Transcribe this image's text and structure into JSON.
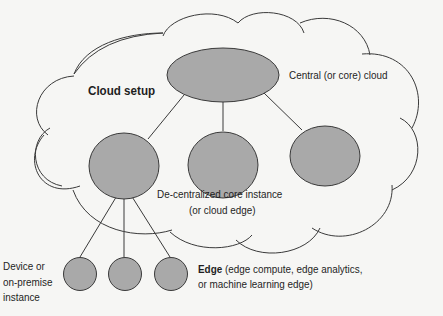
{
  "diagram": {
    "title": "Cloud setup",
    "colors": {
      "background": "#f6f6f4",
      "node_fill": "#a9a9a9",
      "stroke": "#3a3a3a",
      "text": "#1e1e1e"
    },
    "nodes": [
      {
        "id": "central",
        "shape": "ellipse",
        "label": "Central (or core) cloud"
      },
      {
        "id": "core-instance-1",
        "shape": "ellipse",
        "label": "De-centralized core instance (or cloud edge)"
      },
      {
        "id": "core-instance-2",
        "shape": "ellipse"
      },
      {
        "id": "core-instance-3",
        "shape": "ellipse"
      },
      {
        "id": "edge-1",
        "shape": "circle"
      },
      {
        "id": "edge-2",
        "shape": "circle"
      },
      {
        "id": "edge-3",
        "shape": "circle"
      }
    ],
    "edges": [
      [
        "central",
        "core-instance-1"
      ],
      [
        "central",
        "core-instance-2"
      ],
      [
        "central",
        "core-instance-3"
      ],
      [
        "core-instance-1",
        "edge-1"
      ],
      [
        "core-instance-1",
        "edge-2"
      ],
      [
        "core-instance-1",
        "edge-3"
      ]
    ],
    "labels": {
      "cloud_setup": "Cloud setup",
      "central": "Central (or core) cloud",
      "decentralized_line1": "De-centralized core instance",
      "decentralized_line2": "(or cloud edge)",
      "device_line1": "Device or",
      "device_line2": "on-premise",
      "device_line3": "instance",
      "edge_bold": "Edge",
      "edge_rest_line1": " (edge compute, edge analytics,",
      "edge_line2": "or machine learning edge)"
    }
  }
}
